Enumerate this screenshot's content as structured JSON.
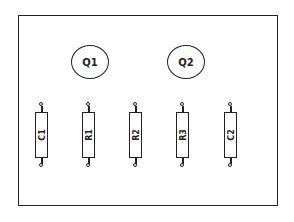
{
  "diagram": {
    "type": "circuit-board-layout",
    "board": {
      "border_color": "#222222"
    },
    "transistors": [
      {
        "label": "Q1"
      },
      {
        "label": "Q2"
      }
    ],
    "components": [
      {
        "label": "C1",
        "kind": "capacitor"
      },
      {
        "label": "R1",
        "kind": "resistor"
      },
      {
        "label": "R2",
        "kind": "resistor"
      },
      {
        "label": "R3",
        "kind": "resistor"
      },
      {
        "label": "C2",
        "kind": "capacitor"
      }
    ]
  }
}
